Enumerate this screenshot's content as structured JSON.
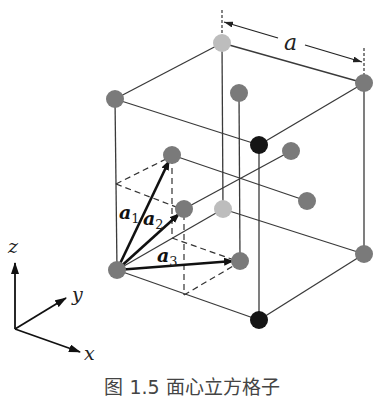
{
  "figure": {
    "caption": "图 1.5   面心立方格子",
    "lattice_constant_label": "a",
    "vectors": [
      {
        "name": "a",
        "sub": "1"
      },
      {
        "name": "a",
        "sub": "2"
      },
      {
        "name": "a",
        "sub": "3"
      }
    ],
    "axes": {
      "x": "x",
      "y": "y",
      "z": "z"
    },
    "colors": {
      "atom_gray": "#7a7a7a",
      "atom_light": "#bdbdbd",
      "atom_black": "#151515",
      "line": "#3a3a3a"
    }
  }
}
